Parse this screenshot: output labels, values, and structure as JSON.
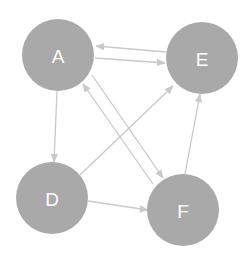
{
  "diagram": {
    "type": "directed-graph",
    "colors": {
      "node_fill": "#a9a9a9",
      "node_label": "#ffffff",
      "edge": "#c9c9c9",
      "background": "#ffffff"
    },
    "nodes": [
      {
        "id": "A",
        "label": "A",
        "cx": 58,
        "cy": 55,
        "r": 36
      },
      {
        "id": "E",
        "label": "E",
        "cx": 202,
        "cy": 58,
        "r": 36
      },
      {
        "id": "D",
        "label": "D",
        "cx": 52,
        "cy": 198,
        "r": 36
      },
      {
        "id": "F",
        "label": "F",
        "cx": 183,
        "cy": 210,
        "r": 36
      }
    ],
    "edges": [
      {
        "from": "E",
        "to": "A",
        "x1": 166,
        "y1": 52,
        "x2": 96,
        "y2": 46
      },
      {
        "from": "A",
        "to": "E",
        "x1": 95,
        "y1": 58,
        "x2": 165,
        "y2": 63
      },
      {
        "from": "A",
        "to": "D",
        "x1": 57,
        "y1": 91,
        "x2": 54,
        "y2": 162
      },
      {
        "from": "A",
        "to": "F",
        "x1": 92,
        "y1": 75,
        "x2": 163,
        "y2": 178
      },
      {
        "from": "F",
        "to": "A",
        "x1": 153,
        "y1": 184,
        "x2": 83,
        "y2": 84
      },
      {
        "from": "D",
        "to": "E",
        "x1": 80,
        "y1": 175,
        "x2": 173,
        "y2": 86
      },
      {
        "from": "D",
        "to": "F",
        "x1": 88,
        "y1": 201,
        "x2": 148,
        "y2": 210
      },
      {
        "from": "F",
        "to": "E",
        "x1": 185,
        "y1": 174,
        "x2": 200,
        "y2": 94
      }
    ]
  }
}
